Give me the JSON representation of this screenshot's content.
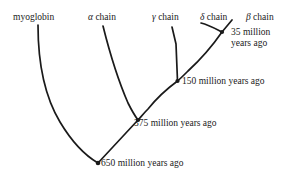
{
  "figure": {
    "type": "phylogenetic-tree-diagram",
    "background_color": "#ffffff",
    "line_color": "#1a1a1a",
    "text_color": "#1a1a1a"
  },
  "tips": [
    {
      "id": "myoglobin",
      "label": "myoglobin",
      "x": 13,
      "y": 12
    },
    {
      "id": "alpha-chain",
      "label": "α chain",
      "x": 88,
      "y": 12
    },
    {
      "id": "gamma-chain",
      "label": "γ chain",
      "x": 152,
      "y": 12
    },
    {
      "id": "delta-chain",
      "label": "δ chain",
      "x": 200,
      "y": 12
    },
    {
      "id": "beta-chain",
      "label": "β chain",
      "x": 246,
      "y": 12
    }
  ],
  "nodes": [
    {
      "id": "node-35",
      "age_value": "35",
      "unit": "million",
      "suffix": "years ago",
      "label": "35 million years ago",
      "line1": "35 million",
      "line2": "years ago",
      "point_x": 222,
      "point_y": 32,
      "label_x": 231,
      "label_y": 27,
      "two_line": true
    },
    {
      "id": "node-150",
      "age_value": "150",
      "unit": "million",
      "suffix": "years ago",
      "label": "150 million years ago",
      "line1": "150 million years ago",
      "line2": "",
      "point_x": 177,
      "point_y": 81,
      "label_x": 182,
      "label_y": 77,
      "two_line": false
    },
    {
      "id": "node-375",
      "age_value": "375",
      "unit": "million",
      "suffix": "years ago",
      "label": "375 million years ago",
      "line1": "375 million years ago",
      "line2": "",
      "point_x": 138,
      "point_y": 120,
      "label_x": 134,
      "label_y": 119,
      "two_line": false
    },
    {
      "id": "node-650",
      "age_value": "650",
      "unit": "million",
      "suffix": "years ago",
      "label": "650 million years ago",
      "line1": "650 million years ago",
      "line2": "",
      "point_x": 98,
      "point_y": 163,
      "label_x": 101,
      "label_y": 159,
      "two_line": false
    }
  ],
  "branches": [
    {
      "id": "branch-myoglobin",
      "from": "myoglobin",
      "to": "node-650"
    },
    {
      "id": "branch-alpha",
      "from": "alpha-chain",
      "to": "node-375"
    },
    {
      "id": "branch-gamma",
      "from": "gamma-chain",
      "to": "node-150"
    },
    {
      "id": "branch-delta",
      "from": "delta-chain",
      "to": "node-35"
    },
    {
      "id": "branch-beta",
      "from": "beta-chain",
      "to": "node-35"
    },
    {
      "id": "branch-trunk-35-150",
      "from": "node-35",
      "to": "node-150"
    },
    {
      "id": "branch-trunk-150-375",
      "from": "node-150",
      "to": "node-375"
    },
    {
      "id": "branch-trunk-375-650",
      "from": "node-375",
      "to": "node-650"
    }
  ]
}
